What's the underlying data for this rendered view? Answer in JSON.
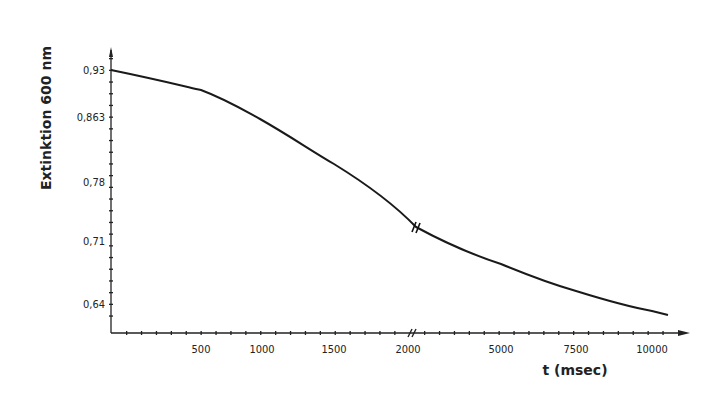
{
  "chart_data": {
    "type": "line",
    "title": "",
    "xlabel": "t (msec)",
    "ylabel": "Extinktion 600 nm",
    "x_break_at": 2000,
    "x_tick_labels": [
      "500",
      "1000",
      "1500",
      "2000",
      "5000",
      "7500",
      "10000"
    ],
    "y_tick_labels": [
      "0,93",
      "0,863",
      "0,78",
      "0,71",
      "0,64"
    ],
    "y_tick_values": [
      0.93,
      0.863,
      0.78,
      0.71,
      0.64
    ],
    "ylim": [
      0.605,
      0.98
    ],
    "grid": false,
    "legend": null,
    "series": [
      {
        "name": "Extinktion",
        "x": [
          0,
          500,
          1000,
          1500,
          2000,
          5000,
          7500,
          10000,
          10500
        ],
        "y": [
          0.93,
          0.908,
          0.868,
          0.812,
          0.734,
          0.691,
          0.656,
          0.633,
          0.626
        ]
      }
    ],
    "line_color": "#1a1a1a"
  },
  "axes": {
    "x_title": "t (msec)",
    "y_title": "Extinktion  600 nm"
  }
}
